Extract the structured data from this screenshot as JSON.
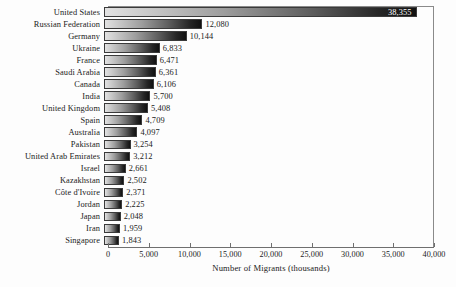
{
  "chart_data": {
    "type": "bar",
    "orientation": "horizontal",
    "title": "",
    "xlabel": "Number of Migrants (thousands)",
    "ylabel": "",
    "xlim": [
      0,
      40000
    ],
    "xticks": [
      "0",
      "5,000",
      "10,000",
      "15,000",
      "20,000",
      "25,000",
      "30,000",
      "35,000",
      "40,000"
    ],
    "xtick_values": [
      0,
      5000,
      10000,
      15000,
      20000,
      25000,
      30000,
      35000,
      40000
    ],
    "grid": false,
    "legend": "none",
    "categories": [
      "United States",
      "Russian Federation",
      "Germany",
      "Ukraine",
      "France",
      "Saudi Arabia",
      "Canada",
      "India",
      "United Kingdom",
      "Spain",
      "Australia",
      "Pakistan",
      "United Arab Emirates",
      "Israel",
      "Kazakhstan",
      "Côte d'Ivoire",
      "Jordan",
      "Japan",
      "Iran",
      "Singapore"
    ],
    "values": [
      38355,
      12080,
      10144,
      6833,
      6471,
      6361,
      6106,
      5700,
      5408,
      4709,
      4097,
      3254,
      3212,
      2661,
      2502,
      2371,
      2225,
      2048,
      1959,
      1843
    ],
    "value_labels": [
      "38,355",
      "12,080",
      "10,144",
      "6,833",
      "6,471",
      "6,361",
      "6,106",
      "5,700",
      "5,408",
      "4,709",
      "4,097",
      "3,254",
      "3,212",
      "2,661",
      "2,502",
      "2,371",
      "2,225",
      "2,048",
      "1,959",
      "1,843"
    ],
    "bar_gradient": {
      "from": "#e2e2e2",
      "to": "#111111"
    },
    "bar_outline": "#3a3a3a",
    "background": "#fdfdfd",
    "axis_color": "#6f6f6f"
  }
}
